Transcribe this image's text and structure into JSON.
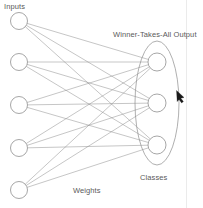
{
  "figure": {
    "type": "diagram",
    "background_color": "#ffffff",
    "stroke_color": "#808080",
    "text_color": "#5a5a5a"
  },
  "labels": {
    "inputs": "Inputs",
    "winner_takes_all_output": "Winner-Takes-All Output",
    "classes": "Classes",
    "weights": "Weights"
  },
  "graph": {
    "input_layer": {
      "name": "Inputs",
      "count": 5,
      "node_radius": 8.5,
      "nodes": [
        {
          "id": "i1",
          "cx": 19,
          "cy": 21
        },
        {
          "id": "i2",
          "cx": 19,
          "cy": 62
        },
        {
          "id": "i3",
          "cx": 19,
          "cy": 105
        },
        {
          "id": "i4",
          "cx": 19,
          "cy": 148
        },
        {
          "id": "i5",
          "cx": 19,
          "cy": 190
        }
      ]
    },
    "output_layer": {
      "name": "Classes",
      "count": 3,
      "node_radius": 9,
      "nodes": [
        {
          "id": "o1",
          "cx": 157,
          "cy": 62
        },
        {
          "id": "o2",
          "cx": 157,
          "cy": 103
        },
        {
          "id": "o3",
          "cx": 157,
          "cy": 145
        }
      ]
    },
    "grouping_ellipse": {
      "label": "Winner-Takes-All Output",
      "cx": 157,
      "cy": 103,
      "rx": 22,
      "ry": 62
    },
    "connections": {
      "label": "Weights",
      "fully_connected": true,
      "edge_count": 15,
      "edges": [
        {
          "from": "i1",
          "to": "o1"
        },
        {
          "from": "i1",
          "to": "o2"
        },
        {
          "from": "i1",
          "to": "o3"
        },
        {
          "from": "i2",
          "to": "o1"
        },
        {
          "from": "i2",
          "to": "o2"
        },
        {
          "from": "i2",
          "to": "o3"
        },
        {
          "from": "i3",
          "to": "o1"
        },
        {
          "from": "i3",
          "to": "o2"
        },
        {
          "from": "i3",
          "to": "o3"
        },
        {
          "from": "i4",
          "to": "o1"
        },
        {
          "from": "i4",
          "to": "o2"
        },
        {
          "from": "i4",
          "to": "o3"
        },
        {
          "from": "i5",
          "to": "o1"
        },
        {
          "from": "i5",
          "to": "o2"
        },
        {
          "from": "i5",
          "to": "o3"
        }
      ]
    }
  },
  "pointer": {
    "name": "mouse-cursor",
    "x": 176,
    "y": 91,
    "direction": "up-left"
  }
}
